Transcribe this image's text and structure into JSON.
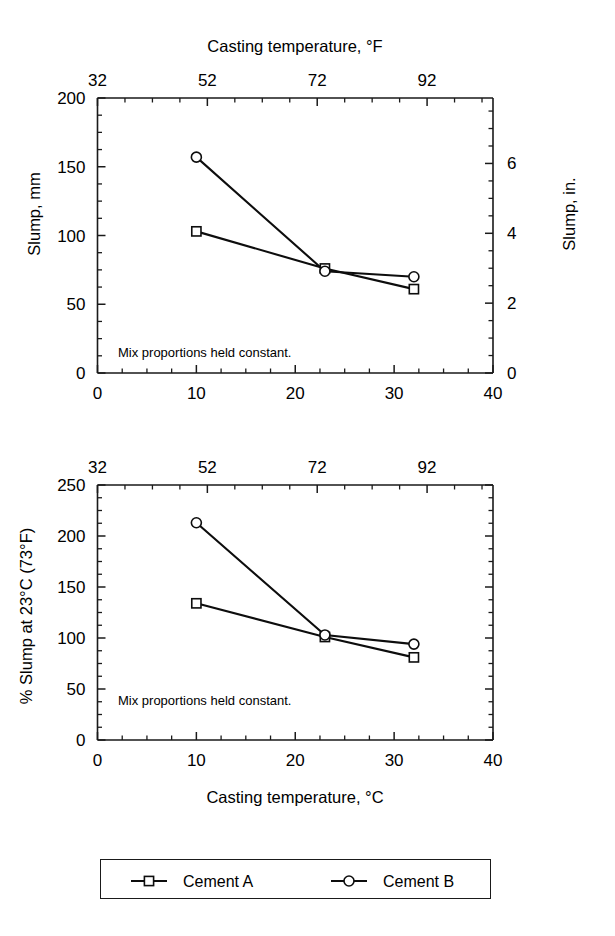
{
  "figure": {
    "background": "#ffffff",
    "ink_color": "#0d0d0d"
  },
  "legend": {
    "entries": [
      {
        "label": "Cement A",
        "marker": "square-marker-icon"
      },
      {
        "label": "Cement B",
        "marker": "circle-marker-icon"
      }
    ]
  },
  "chart_data": [
    {
      "id": "slump-vs-casting-temperature",
      "type": "line",
      "title": "",
      "note": "Mix proportions held constant.",
      "top_axis": {
        "label": "Casting temperature, °F",
        "ticks": [
          32,
          52,
          72,
          92
        ],
        "lim": [
          32,
          104
        ],
        "minor_step": 5
      },
      "xlabel": "",
      "x_ticks": [
        0,
        10,
        20,
        30,
        40
      ],
      "xlim": [
        0,
        40
      ],
      "x_minor_step": 2.5,
      "ylabel": "Slump, mm",
      "y_ticks": [
        0,
        50,
        100,
        150,
        200
      ],
      "ylim": [
        0,
        200
      ],
      "y_minor_step": 12.5,
      "y2label": "Slump, in.",
      "y2_ticks": [
        0,
        2,
        4,
        6
      ],
      "y2lim": [
        0,
        7.874
      ],
      "y2_minor_step": 0.5,
      "grid": false,
      "series": [
        {
          "name": "Cement A",
          "marker": "square",
          "x": [
            10,
            23,
            32
          ],
          "values": [
            103,
            76,
            61
          ]
        },
        {
          "name": "Cement B",
          "marker": "circle",
          "x": [
            10,
            23,
            32
          ],
          "values": [
            157,
            74,
            70
          ]
        }
      ]
    },
    {
      "id": "percent-slump-vs-casting-temperature",
      "type": "line",
      "title": "",
      "note": "Mix proportions held constant.",
      "top_axis": {
        "label": "",
        "ticks": [
          32,
          52,
          72,
          92
        ],
        "lim": [
          32,
          104
        ],
        "minor_step": 5
      },
      "xlabel": "Casting temperature, °C",
      "x_ticks": [
        0,
        10,
        20,
        30,
        40
      ],
      "xlim": [
        0,
        40
      ],
      "x_minor_step": 2.5,
      "ylabel": "% Slump at 23°C (73°F)",
      "y_ticks": [
        0,
        50,
        100,
        150,
        200,
        250
      ],
      "ylim": [
        0,
        250
      ],
      "y_minor_step": 12.5,
      "grid": false,
      "series": [
        {
          "name": "Cement A",
          "marker": "square",
          "x": [
            10,
            23,
            32
          ],
          "values": [
            134,
            101,
            81
          ]
        },
        {
          "name": "Cement B",
          "marker": "circle",
          "x": [
            10,
            23,
            32
          ],
          "values": [
            213,
            103,
            94
          ]
        }
      ]
    }
  ]
}
